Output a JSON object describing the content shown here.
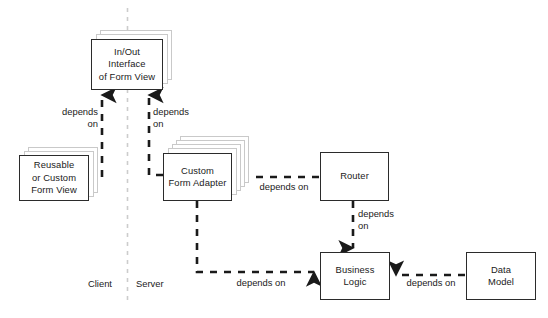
{
  "diagram": {
    "title_visible": false,
    "colors": {
      "node_border": "#2b2b2b",
      "node_fill": "#ffffff",
      "stack_border": "#c9c9c9",
      "connector": "#1a1a1a",
      "divider": "#cccccc",
      "background": "#ffffff"
    },
    "zones": [
      {
        "id": "client",
        "label": "Client"
      },
      {
        "id": "server",
        "label": "Server"
      }
    ],
    "divider": {
      "orientation": "vertical",
      "style": "dashed"
    },
    "nodes": [
      {
        "id": "inout-interface",
        "label": "In/Out\nInterface\nof Form View",
        "stacked": true,
        "stack_count": 3
      },
      {
        "id": "reusable-form-view",
        "label": "Reusable\nor Custom\nForm View",
        "stacked": true,
        "stack_count": 3
      },
      {
        "id": "custom-form-adapter",
        "label": "Custom\nForm Adapter",
        "stacked": true,
        "stack_count": 5
      },
      {
        "id": "router",
        "label": "Router",
        "stacked": false,
        "stack_count": 0
      },
      {
        "id": "business-logic",
        "label": "Business\nLogic",
        "stacked": false,
        "stack_count": 0
      },
      {
        "id": "data-model",
        "label": "Data\nModel",
        "stacked": false,
        "stack_count": 0
      }
    ],
    "edges": [
      {
        "id": "reusable-to-interface",
        "from": "reusable-form-view",
        "to": "inout-interface",
        "label": "depends\non",
        "style": "dashed",
        "arrow": "up"
      },
      {
        "id": "adapter-to-interface",
        "from": "custom-form-adapter",
        "to": "inout-interface",
        "label": "depends\non",
        "style": "dashed",
        "arrow": "up"
      },
      {
        "id": "router-to-adapter",
        "from": "router",
        "to": "custom-form-adapter",
        "label": "depends on",
        "style": "dashed",
        "arrow": "left"
      },
      {
        "id": "router-to-business-logic",
        "from": "router",
        "to": "business-logic",
        "label": "depends\non",
        "style": "dashed",
        "arrow": "down"
      },
      {
        "id": "adapter-to-business-logic",
        "from": "custom-form-adapter",
        "to": "business-logic",
        "label": "depends on",
        "style": "dashed",
        "arrow": "right"
      },
      {
        "id": "data-model-to-business-logic",
        "from": "data-model",
        "to": "business-logic",
        "label": "depends on",
        "style": "dashed",
        "arrow": "left"
      }
    ]
  }
}
